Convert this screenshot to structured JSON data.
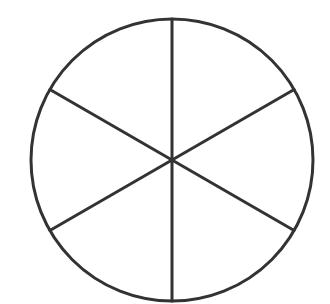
{
  "diagram": {
    "type": "circle-divided-into-sectors",
    "sectors": 6,
    "center": [
      172,
      160
    ],
    "radius": 141,
    "stroke_color": "#333333",
    "stroke_width": 3,
    "background": "#ffffff",
    "spoke_angles_deg": [
      90,
      30,
      -30,
      -90,
      -150,
      150
    ]
  }
}
